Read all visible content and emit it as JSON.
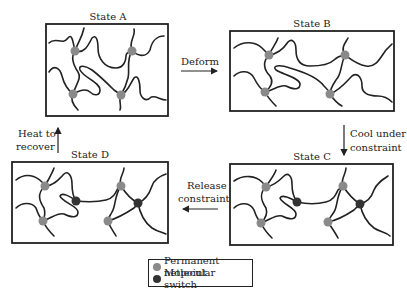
{
  "colors": {
    "permanent_netpoint": "#8a8a8a",
    "molecular_switch": "#333333",
    "chain": "#222222",
    "frame": "#222222"
  },
  "states": [
    {
      "id": "A",
      "title": "State A"
    },
    {
      "id": "B",
      "title": "State B"
    },
    {
      "id": "C",
      "title": "State C"
    },
    {
      "id": "D",
      "title": "State D"
    }
  ],
  "transitions": [
    {
      "from": "A",
      "to": "B",
      "label_lines": [
        "Deform"
      ],
      "direction": "right"
    },
    {
      "from": "B",
      "to": "C",
      "label_lines": [
        "Cool under",
        "constraint"
      ],
      "direction": "down"
    },
    {
      "from": "C",
      "to": "D",
      "label_lines": [
        "Release",
        "constraint"
      ],
      "direction": "left"
    },
    {
      "from": "D",
      "to": "A",
      "label_lines": [
        "Heat to",
        "recover"
      ],
      "direction": "up"
    }
  ],
  "legend": {
    "items": [
      {
        "label": "Permanent netpoint",
        "color": "#8a8a8a",
        "icon": "gray-circle-icon"
      },
      {
        "label": "Molecular switch",
        "color": "#333333",
        "icon": "dark-circle-icon"
      }
    ]
  }
}
